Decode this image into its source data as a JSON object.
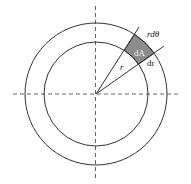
{
  "diagram": {
    "center": {
      "x": 96,
      "y": 94
    },
    "outer_radius": 71,
    "inner_radius": 52,
    "ray_angles_deg": [
      57,
      35
    ],
    "labels": {
      "area_element": "dA",
      "arc_length": "rdθ",
      "radial_increment": "dr",
      "radius": "r"
    },
    "colors": {
      "stroke": "#333333",
      "axis": "#555555",
      "shade": "#8c8c8c",
      "label_on_shade": "#f2f2f2"
    }
  }
}
